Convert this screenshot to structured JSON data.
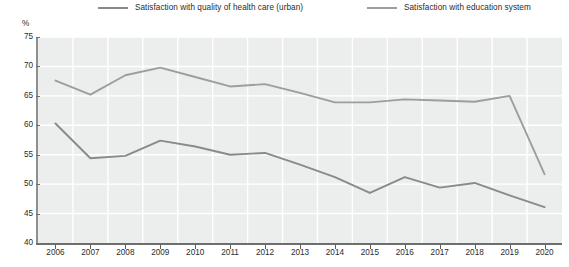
{
  "legend": {
    "items": [
      {
        "label": "Satisfaction with quality of health care (urban)",
        "color": "#8a8a8a",
        "name": "legend-health-care"
      },
      {
        "label": "Satisfaction with education system",
        "color": "#9d9d9d",
        "name": "legend-education"
      }
    ]
  },
  "axis": {
    "unit_label": "%"
  },
  "chart_data": {
    "type": "line",
    "title": "",
    "subtitle": "",
    "xlabel": "",
    "ylabel": "%",
    "ylim": [
      40,
      75
    ],
    "yticks": [
      40,
      45,
      50,
      55,
      60,
      65,
      70,
      75
    ],
    "grid": true,
    "legend_position": "top",
    "x": [
      2006,
      2007,
      2008,
      2009,
      2010,
      2011,
      2012,
      2013,
      2014,
      2015,
      2016,
      2017,
      2018,
      2019,
      2020
    ],
    "categories": [
      "2006",
      "2007",
      "2008",
      "2009",
      "2010",
      "2011",
      "2012",
      "2013",
      "2014",
      "2015",
      "2016",
      "2017",
      "2018",
      "2019",
      "2020"
    ],
    "series": [
      {
        "name": "Satisfaction with quality of health care (urban)",
        "color": "#8a8a8a",
        "values": [
          60.3,
          54.4,
          54.8,
          57.4,
          56.4,
          55.0,
          55.3,
          53.3,
          51.2,
          48.5,
          51.2,
          49.4,
          50.2,
          48.1,
          46.1
        ]
      },
      {
        "name": "Satisfaction with education system",
        "color": "#9d9d9d",
        "values": [
          67.6,
          65.2,
          68.5,
          69.8,
          68.2,
          66.6,
          67.0,
          65.5,
          63.9,
          63.9,
          64.4,
          64.2,
          64.0,
          65.0,
          51.7
        ]
      }
    ]
  },
  "colors": {
    "plot_background": "#eceded",
    "gridline": "#ffffff",
    "axis": "#6e6e6e",
    "text": "#2b2b2b"
  }
}
